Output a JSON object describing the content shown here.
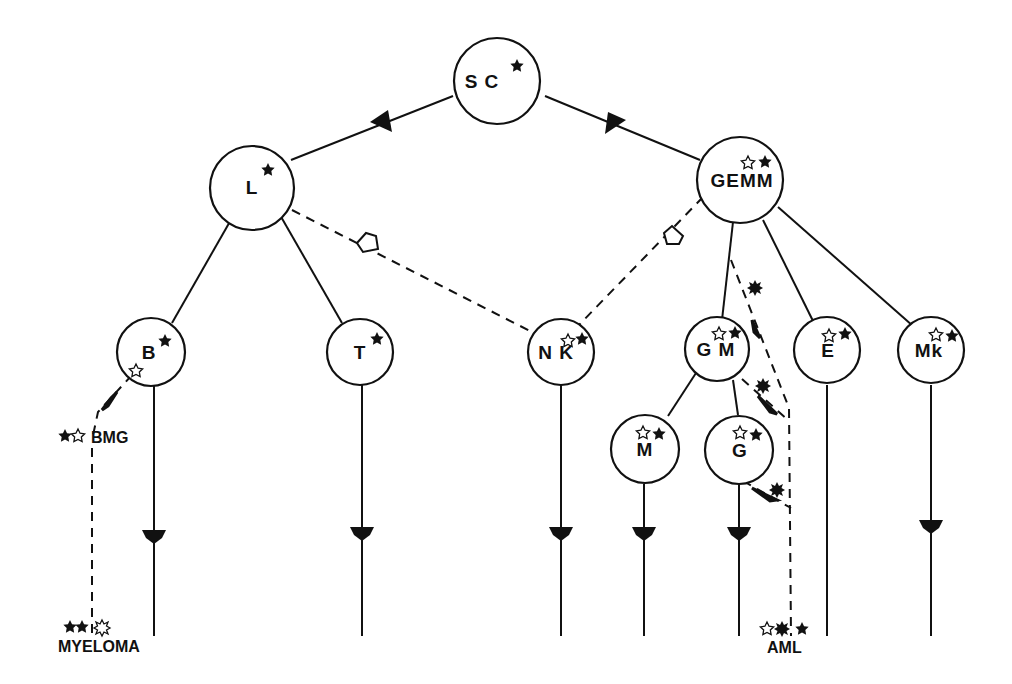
{
  "diagram": {
    "type": "hematopoietic lineage tree",
    "colors": {
      "ink": "#111111",
      "background": "#ffffff"
    },
    "nodes": [
      {
        "id": "SC",
        "label": "S C",
        "markers": [
          "filled-star"
        ]
      },
      {
        "id": "L",
        "label": "L",
        "markers": [
          "filled-star"
        ]
      },
      {
        "id": "GEMM",
        "label": "GEMM",
        "markers": [
          "open-star",
          "filled-star"
        ]
      },
      {
        "id": "B",
        "label": "B",
        "markers": [
          "filled-star",
          "open-star"
        ]
      },
      {
        "id": "T",
        "label": "T",
        "markers": [
          "filled-star"
        ]
      },
      {
        "id": "NK",
        "label": "N K",
        "markers": [
          "open-star",
          "filled-star"
        ]
      },
      {
        "id": "GM",
        "label": "G M",
        "markers": [
          "open-star",
          "filled-star"
        ]
      },
      {
        "id": "E",
        "label": "E",
        "markers": [
          "open-star",
          "filled-star"
        ]
      },
      {
        "id": "Mk",
        "label": "Mk",
        "markers": [
          "open-star",
          "filled-star"
        ]
      },
      {
        "id": "M",
        "label": "M",
        "markers": [
          "open-star",
          "filled-star"
        ]
      },
      {
        "id": "G",
        "label": "G",
        "markers": [
          "open-star",
          "filled-star"
        ]
      }
    ],
    "edges": [
      {
        "from": "SC",
        "to": "L",
        "style": "solid",
        "arrow": "filled"
      },
      {
        "from": "SC",
        "to": "GEMM",
        "style": "solid",
        "arrow": "filled"
      },
      {
        "from": "L",
        "to": "B",
        "style": "solid"
      },
      {
        "from": "L",
        "to": "T",
        "style": "solid"
      },
      {
        "from": "L",
        "to": "NK",
        "style": "dashed",
        "arrow": "open"
      },
      {
        "from": "GEMM",
        "to": "NK",
        "style": "dashed",
        "arrow": "open"
      },
      {
        "from": "GEMM",
        "to": "GM",
        "style": "solid"
      },
      {
        "from": "GEMM",
        "to": "E",
        "style": "solid"
      },
      {
        "from": "GEMM",
        "to": "Mk",
        "style": "solid"
      },
      {
        "from": "GM",
        "to": "M",
        "style": "solid"
      },
      {
        "from": "GM",
        "to": "G",
        "style": "solid"
      },
      {
        "from": "B",
        "to": "BMG",
        "style": "dashed",
        "arrow": "filled"
      },
      {
        "from": "BMG",
        "to": "MYELOMA",
        "style": "dashed"
      },
      {
        "from": "GEMM",
        "to": "AML",
        "style": "dashed",
        "marker": "filled-sun"
      },
      {
        "from": "GM",
        "to": "AML",
        "style": "dashed",
        "marker": "filled-sun"
      },
      {
        "from": "G",
        "to": "AML",
        "style": "dashed",
        "marker": "filled-sun"
      }
    ],
    "outcomes": [
      {
        "id": "BMG",
        "label": "BMG",
        "markers": [
          "filled-star",
          "open-star"
        ]
      },
      {
        "id": "MYELOMA",
        "label": "MYELOMA",
        "markers": [
          "filled-star",
          "filled-star",
          "open-sun"
        ]
      },
      {
        "id": "AML",
        "label": "AML",
        "markers": [
          "open-star",
          "filled-sun",
          "filled-star"
        ]
      }
    ]
  }
}
